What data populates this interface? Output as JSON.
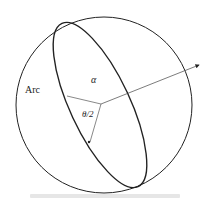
{
  "diagram": {
    "labels": {
      "arc": "Arc",
      "alpha": "α",
      "half_angle": "θ/2"
    },
    "colors": {
      "stroke": "#222222",
      "background": "#ffffff"
    }
  }
}
